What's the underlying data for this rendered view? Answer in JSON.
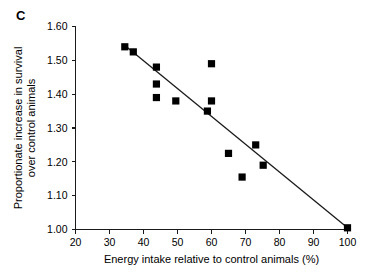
{
  "panel": {
    "label": "C"
  },
  "chart_data": {
    "type": "scatter",
    "title": "",
    "xlabel": "Energy intake relative to control animals (%)",
    "ylabel_line1": "Proportionate increase in survival",
    "ylabel_line2": "over control animals",
    "xlim": [
      20,
      100
    ],
    "ylim": [
      1.0,
      1.6
    ],
    "xticks": [
      20,
      30,
      40,
      50,
      60,
      70,
      80,
      90,
      100
    ],
    "xtick_labels": [
      "20",
      "30",
      "40",
      "50",
      "60",
      "70",
      "80",
      "90",
      "100"
    ],
    "yticks": [
      1.0,
      1.1,
      1.2,
      1.3,
      1.4,
      1.5,
      1.6
    ],
    "ytick_labels": [
      "1.00",
      "1.10",
      "1.20",
      "1.30",
      "1.40",
      "1.50",
      "1.60"
    ],
    "grid": false,
    "legend": false,
    "marker": "square",
    "marker_color": "#000000",
    "points": [
      {
        "x": 34.5,
        "y": 1.54
      },
      {
        "x": 37.0,
        "y": 1.525
      },
      {
        "x": 43.8,
        "y": 1.48
      },
      {
        "x": 43.8,
        "y": 1.43
      },
      {
        "x": 43.8,
        "y": 1.39
      },
      {
        "x": 49.5,
        "y": 1.38
      },
      {
        "x": 60.0,
        "y": 1.49
      },
      {
        "x": 60.0,
        "y": 1.38
      },
      {
        "x": 58.8,
        "y": 1.35
      },
      {
        "x": 65.0,
        "y": 1.225
      },
      {
        "x": 69.0,
        "y": 1.155
      },
      {
        "x": 73.0,
        "y": 1.25
      },
      {
        "x": 75.2,
        "y": 1.19
      },
      {
        "x": 100.0,
        "y": 1.005
      }
    ],
    "fit_line": {
      "name": "regression-line",
      "x1": 34.0,
      "y1": 1.548,
      "x2": 100.0,
      "y2": 1.005,
      "color": "#1a1a1a"
    }
  }
}
